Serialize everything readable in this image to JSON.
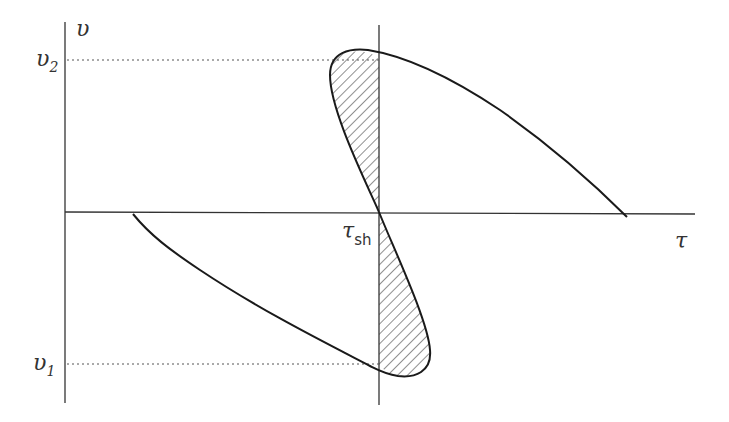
{
  "diagram": {
    "axes": {
      "y_label": "υ",
      "x_label": "τ"
    },
    "ticks": {
      "v2": {
        "symbol": "υ",
        "subscript": "2"
      },
      "v1": {
        "symbol": "υ",
        "subscript": "1"
      },
      "tau_sh": {
        "symbol": "τ",
        "subscript": "sh"
      }
    },
    "colors": {
      "line": "#1a1a1a",
      "axis": "#333333",
      "hatch": "#333333"
    }
  }
}
